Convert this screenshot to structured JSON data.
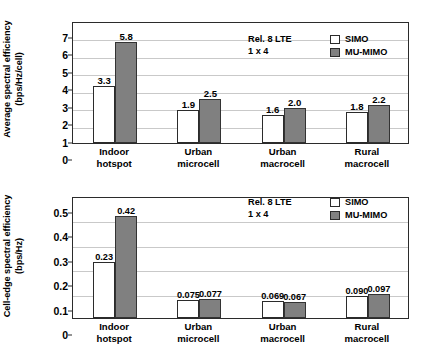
{
  "chart_data": [
    {
      "type": "bar",
      "title": "",
      "ylabel": "Average spectral efficiency\n(bps/Hz/cell)",
      "xlabel": "",
      "ylim": [
        0,
        7
      ],
      "yticks": [
        "0",
        "1",
        "2",
        "3",
        "4",
        "5",
        "6",
        "7"
      ],
      "grid": true,
      "legend_position": "top-right",
      "annotation": "Rel. 8 LTE\n1 x 4",
      "categories": [
        "Indoor\nhotspot",
        "Urban\nmicrocell",
        "Urban\nmacrocell",
        "Rural\nmacrocell"
      ],
      "series": [
        {
          "name": "SIMO",
          "color": "#ffffff",
          "values": [
            3.3,
            1.9,
            1.6,
            1.8
          ],
          "labels": [
            "3.3",
            "1.9",
            "1.6",
            "1.8"
          ]
        },
        {
          "name": "MU-MIMO",
          "color": "#808080",
          "values": [
            5.8,
            2.5,
            2.0,
            2.2
          ],
          "labels": [
            "5.8",
            "2.5",
            "2.0",
            "2.2"
          ]
        }
      ]
    },
    {
      "type": "bar",
      "title": "",
      "ylabel": "Cell-edge spectral efficiency\n(bps/Hz)",
      "xlabel": "",
      "ylim": [
        0,
        0.5
      ],
      "yticks": [
        "0",
        "0.1",
        "0.2",
        "0.3",
        "0.4",
        "0.5"
      ],
      "grid": true,
      "legend_position": "top-right",
      "annotation": "Rel. 8 LTE\n1 x 4",
      "categories": [
        "Indoor\nhotspot",
        "Urban\nmicrocell",
        "Urban\nmacrocell",
        "Rural\nmacrocell"
      ],
      "series": [
        {
          "name": "SIMO",
          "color": "#ffffff",
          "values": [
            0.23,
            0.075,
            0.069,
            0.09
          ],
          "labels": [
            "0.23",
            "0.075",
            "0.069",
            "0.090"
          ]
        },
        {
          "name": "MU-MIMO",
          "color": "#808080",
          "values": [
            0.42,
            0.077,
            0.067,
            0.097
          ],
          "labels": [
            "0.42",
            "0.077",
            "0.067",
            "0.097"
          ]
        }
      ]
    }
  ],
  "colors": {
    "simo": "#ffffff",
    "mumimo": "#808080",
    "axis": "#2b2b2b",
    "grid": "#c9c9c9",
    "background": "#ffffff"
  }
}
